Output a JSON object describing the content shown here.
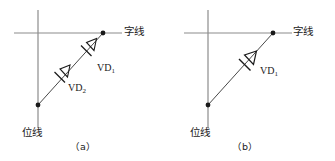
{
  "figure": {
    "kind": "circuit-diagram",
    "colors": {
      "line_gray": "#8c8c8c",
      "line_black": "#262626",
      "text": "#1a1a1a",
      "background": "#ffffff"
    }
  },
  "panels": [
    {
      "id": "a",
      "caption": "（a）",
      "word_line_label": "字线",
      "bit_line_label": "位线",
      "components": [
        {
          "id": "VD1",
          "label": "VD",
          "subscript": "1",
          "type": "diode"
        },
        {
          "id": "VD2",
          "label": "VD",
          "subscript": "2",
          "type": "diode"
        }
      ],
      "diode_count": 2,
      "nodes": [
        {
          "name": "word-line-node",
          "x": 103,
          "y": 33
        },
        {
          "name": "bit-line-node",
          "x": 38,
          "y": 105
        }
      ]
    },
    {
      "id": "b",
      "caption": "（b）",
      "word_line_label": "字线",
      "bit_line_label": "位线",
      "components": [
        {
          "id": "VD1",
          "label": "VD",
          "subscript": "1",
          "type": "diode"
        }
      ],
      "diode_count": 1,
      "nodes": [
        {
          "name": "word-line-node",
          "x": 105,
          "y": 33
        },
        {
          "name": "bit-line-node",
          "x": 40,
          "y": 105
        }
      ]
    }
  ]
}
